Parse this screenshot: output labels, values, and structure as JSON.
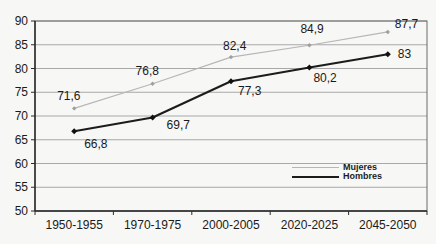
{
  "chart_data": {
    "type": "line",
    "title": "",
    "xlabel": "",
    "ylabel": "",
    "categories": [
      "1950-1955",
      "1970-1975",
      "2000-2005",
      "2020-2025",
      "2045-2050"
    ],
    "ylim": [
      50,
      90
    ],
    "yticks": [
      50,
      55,
      60,
      65,
      70,
      75,
      80,
      85,
      90
    ],
    "grid": true,
    "legend_position": "inside-right",
    "colors": {
      "gridline": "#a8a8a8",
      "plot_border": "#6a6a6a",
      "axis": "#2a2a2a",
      "text": "#1a1a1a"
    },
    "series": [
      {
        "name": "Mujeres",
        "color": "#b6b6b6",
        "marker_color": "#9f9f9f",
        "line_width": 1.2,
        "marker_size": 4.4,
        "values": [
          71.6,
          76.8,
          82.4,
          84.9,
          87.7
        ],
        "point_labels": [
          "71,6",
          "76,8",
          "82,4",
          "84,9",
          "87,7"
        ],
        "label_offsets": [
          [
            -17,
            -8
          ],
          [
            -17,
            -9
          ],
          [
            -8,
            -7
          ],
          [
            -9,
            -12
          ],
          [
            7,
            -4
          ]
        ]
      },
      {
        "name": "Hombres",
        "color": "#1c1c1c",
        "marker_color": "#111111",
        "line_width": 2.1,
        "marker_size": 6,
        "values": [
          66.8,
          69.7,
          77.3,
          80.2,
          83
        ],
        "point_labels": [
          "66,8",
          "69,7",
          "77,3",
          "80,2",
          "83"
        ],
        "label_offsets": [
          [
            10,
            17
          ],
          [
            14,
            12
          ],
          [
            7,
            14
          ],
          [
            4,
            14
          ],
          [
            10,
            4
          ]
        ]
      }
    ]
  }
}
